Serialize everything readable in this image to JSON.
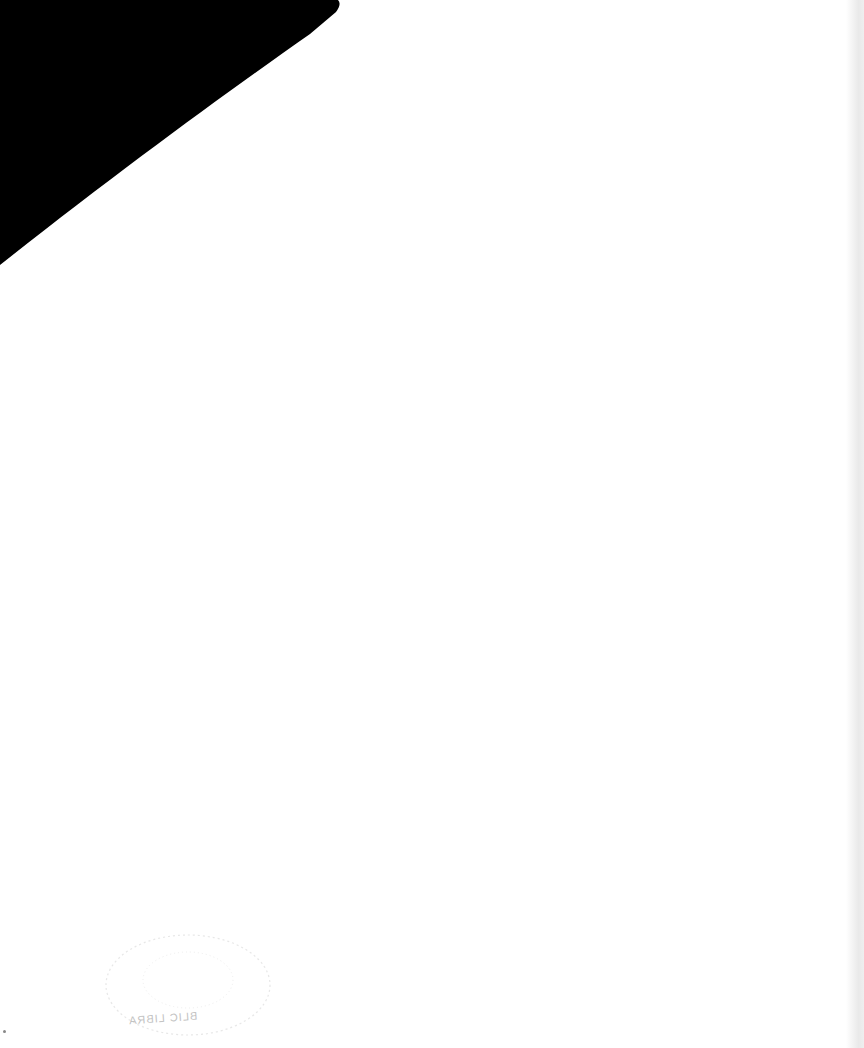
{
  "page": {
    "background_color": "#ffffff",
    "corner_shape_color": "#000000",
    "stamp": {
      "visible_text": "BLIC LIBRA",
      "color": "#9a9a9a",
      "mirrored": true
    }
  }
}
